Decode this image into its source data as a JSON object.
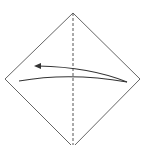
{
  "diagram": {
    "type": "origami-fold-step",
    "background": "#ffffff",
    "stroke_color": "#555555",
    "arrow_color": "#333333",
    "square": {
      "top": [
        73,
        13
      ],
      "left": [
        5,
        79
      ],
      "right": [
        140,
        79
      ],
      "bottom": [
        73,
        147
      ]
    },
    "crease": {
      "style": "dashed",
      "x": 73,
      "y1": 13,
      "y2": 145
    },
    "fold_arrow": {
      "direction": "right-to-left",
      "from": [
        127,
        82
      ],
      "to": [
        36,
        66
      ]
    }
  }
}
